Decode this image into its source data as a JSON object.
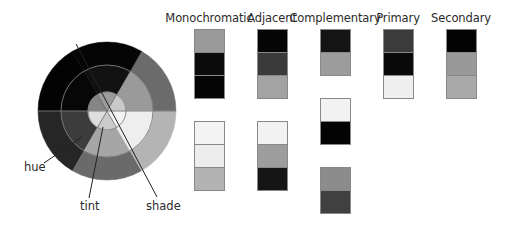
{
  "wheel": {
    "center": [
      107,
      111
    ],
    "radii": {
      "outer": 69,
      "middle": 46,
      "inner": 19
    },
    "sectors": [
      {
        "id": "upper-right",
        "start_deg": 0,
        "end_deg": 60,
        "outer": "#6b6b6b",
        "middle": "#9a9a9a",
        "inner": "#c9c9c9"
      },
      {
        "id": "top",
        "start_deg": 60,
        "end_deg": 120,
        "outer": "#050505",
        "middle": "#111111",
        "inner": "#9c9c9c"
      },
      {
        "id": "upper-left",
        "start_deg": 120,
        "end_deg": 180,
        "outer": "#030303",
        "middle": "#070707",
        "inner": "#858585"
      },
      {
        "id": "lower-left",
        "start_deg": 180,
        "end_deg": 240,
        "outer": "#262626",
        "middle": "#3c3c3c",
        "inner": "#dedede"
      },
      {
        "id": "bottom",
        "start_deg": 240,
        "end_deg": 300,
        "outer": "#6a6a6a",
        "middle": "#a6a6a6",
        "inner": "#cbcbcb"
      },
      {
        "id": "lower-right",
        "start_deg": 300,
        "end_deg": 360,
        "outer": "#b4b4b4",
        "middle": "#eeeeee",
        "inner": "#f4f4f4"
      }
    ],
    "callouts": [
      {
        "label": "hue",
        "label_pos": [
          24,
          160
        ],
        "line": [
          [
            44,
            163
          ],
          [
            82,
            137
          ]
        ]
      },
      {
        "label": "tint",
        "label_pos": [
          80,
          199
        ],
        "line": [
          [
            89,
            198
          ],
          [
            103,
            127
          ]
        ]
      },
      {
        "label": "shade",
        "label_pos": [
          146,
          199
        ],
        "line": [
          [
            157,
            197
          ],
          [
            76,
            44
          ]
        ]
      }
    ]
  },
  "schemes": [
    {
      "label": "Monochromatic",
      "label_x": 209,
      "swatches": [
        {
          "x": 194,
          "y": 29,
          "colors": [
            "#9a9a9a",
            "#0b0b0b",
            "#050505"
          ]
        },
        {
          "x": 194,
          "y": 121,
          "colors": [
            "#f4f4f4",
            "#ededed",
            "#b3b3b3"
          ]
        }
      ]
    },
    {
      "label": "Adjacent",
      "label_x": 272,
      "swatches": [
        {
          "x": 257,
          "y": 29,
          "colors": [
            "#050505",
            "#3a3a3a",
            "#a3a3a3"
          ]
        },
        {
          "x": 257,
          "y": 121,
          "colors": [
            "#f2f2f2",
            "#9d9d9d",
            "#151515"
          ]
        }
      ]
    },
    {
      "label": "Complementary",
      "label_x": 335,
      "swatches": [
        {
          "x": 320,
          "y": 29,
          "colors": [
            "#141414",
            "#9c9c9c"
          ]
        },
        {
          "x": 320,
          "y": 98,
          "colors": [
            "#f2f2f2",
            "#030303"
          ]
        },
        {
          "x": 320,
          "y": 167,
          "colors": [
            "#8c8c8c",
            "#404040"
          ]
        }
      ]
    },
    {
      "label": "Primary",
      "label_x": 398,
      "swatches": [
        {
          "x": 383,
          "y": 29,
          "colors": [
            "#3b3b3b",
            "#0a0a0a",
            "#efefef"
          ]
        }
      ]
    },
    {
      "label": "Secondary",
      "label_x": 461,
      "swatches": [
        {
          "x": 446,
          "y": 29,
          "colors": [
            "#030303",
            "#999999",
            "#a9a9a9"
          ]
        }
      ]
    }
  ]
}
